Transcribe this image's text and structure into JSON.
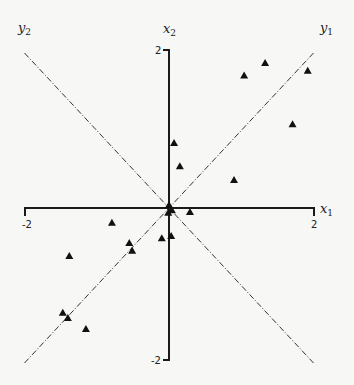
{
  "chart_data": {
    "type": "scatter",
    "title": "",
    "xlabel": "x1",
    "ylabel": "x2",
    "xlim": [
      -2,
      2
    ],
    "ylim": [
      -2,
      2
    ],
    "grid": false,
    "tick_labels": {
      "x_min": "-2",
      "x_max": "2",
      "y_min": "-2",
      "y_max": "2"
    },
    "axis_labels": {
      "x1": {
        "base": "x",
        "sub": "1"
      },
      "x2": {
        "base": "x",
        "sub": "2"
      },
      "y1": {
        "base": "y",
        "sub": "1"
      },
      "y2": {
        "base": "y",
        "sub": "2"
      }
    },
    "reference_lines": [
      {
        "name": "y1",
        "style": "dash-dot",
        "from": [
          -2,
          -2
        ],
        "to": [
          2,
          2
        ]
      },
      {
        "name": "y2",
        "style": "dash-dot",
        "from": [
          -2,
          2
        ],
        "to": [
          2,
          -2
        ]
      }
    ],
    "marker": "triangle",
    "series": [
      {
        "name": "observations",
        "points": [
          [
            1.04,
            1.71
          ],
          [
            1.33,
            1.87
          ],
          [
            1.92,
            1.77
          ],
          [
            1.71,
            1.08
          ],
          [
            0.9,
            0.36
          ],
          [
            0.07,
            0.84
          ],
          [
            0.15,
            0.54
          ],
          [
            0.29,
            -0.05
          ],
          [
            0.0,
            0.04
          ],
          [
            0.04,
            -0.03
          ],
          [
            -0.01,
            -0.06
          ],
          [
            0.03,
            -0.36
          ],
          [
            -0.1,
            -0.39
          ],
          [
            -0.79,
            -0.19
          ],
          [
            -0.55,
            -0.45
          ],
          [
            -0.51,
            -0.55
          ],
          [
            -1.38,
            -0.62
          ],
          [
            -1.47,
            -1.35
          ],
          [
            -1.4,
            -1.42
          ],
          [
            -1.15,
            -1.56
          ]
        ]
      }
    ]
  },
  "layout": {
    "x_px": [
      25,
      314
    ],
    "y_px": [
      360,
      50
    ],
    "origin_px": [
      169,
      208
    ]
  }
}
